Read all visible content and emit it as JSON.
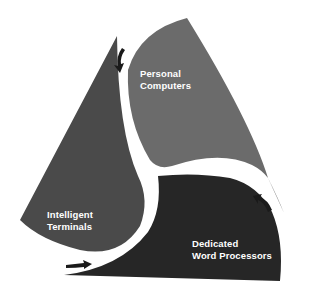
{
  "diagram": {
    "type": "cyclic-three-segment-triangle",
    "segments": [
      {
        "id": "personal-computers",
        "label_lines": [
          "Personal",
          "Computers"
        ],
        "fill": "#6b6b6b",
        "position": "top-right"
      },
      {
        "id": "intelligent-terminals",
        "label_lines": [
          "Intelligent",
          "Terminals"
        ],
        "fill": "#4a4a4a",
        "position": "left"
      },
      {
        "id": "dedicated-word-processors",
        "label_lines": [
          "Dedicated",
          "Word Processors"
        ],
        "fill": "#262626",
        "position": "bottom-right"
      }
    ],
    "arrows": [
      {
        "from": "personal-computers",
        "to": "intelligent-terminals",
        "direction": "down"
      },
      {
        "from": "intelligent-terminals",
        "to": "dedicated-word-processors",
        "direction": "right"
      },
      {
        "from": "dedicated-word-processors",
        "to": "personal-computers",
        "direction": "up"
      }
    ],
    "colors": {
      "background": "#ffffff",
      "separator": "#ffffff",
      "text": "#ffffff",
      "arrow": "#1a1a1a"
    }
  },
  "labels": {
    "pc": {
      "line1": "Personal",
      "line2": "Computers"
    },
    "it": {
      "line1": "Intelligent",
      "line2": "Terminals"
    },
    "wp": {
      "line1": "Dedicated",
      "line2": "Word Processors"
    }
  }
}
